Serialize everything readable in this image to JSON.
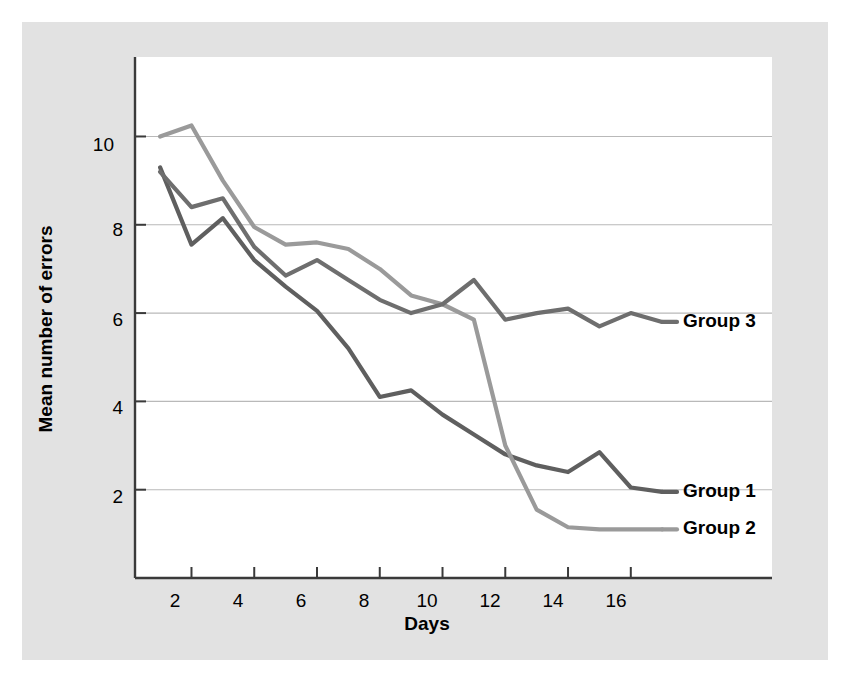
{
  "chart_data": {
    "type": "line",
    "title": "",
    "xlabel": "Days",
    "ylabel": "Mean number of errors",
    "xlim": [
      0.2,
      20.5
    ],
    "ylim": [
      0,
      11.8
    ],
    "xticks": [
      2,
      4,
      6,
      8,
      10,
      12,
      14,
      16
    ],
    "yticks": [
      2,
      4,
      6,
      8,
      10
    ],
    "xtick_labels": [
      "2",
      "4",
      "6",
      "8",
      "10",
      "12",
      "14",
      "16"
    ],
    "ytick_labels": [
      "2",
      "4",
      "6",
      "8",
      "10"
    ],
    "grid": "horizontal",
    "legend_position": "inline-right",
    "x": [
      1,
      2,
      3,
      4,
      5,
      6,
      7,
      8,
      9,
      10,
      11,
      12,
      13,
      14,
      15,
      16,
      17
    ],
    "series": [
      {
        "name": "Group 1",
        "color": "#5f5f5f",
        "values": [
          9.3,
          7.55,
          8.15,
          7.2,
          6.6,
          6.05,
          5.2,
          4.1,
          4.25,
          3.7,
          3.25,
          2.8,
          2.55,
          2.4,
          2.85,
          2.05,
          1.95
        ],
        "label_x": 17.6,
        "label_y": 1.95
      },
      {
        "name": "Group 2",
        "color": "#9a9a9a",
        "values": [
          10.0,
          10.25,
          9.0,
          7.95,
          7.55,
          7.6,
          7.45,
          7.0,
          6.4,
          6.2,
          5.85,
          3.0,
          1.55,
          1.15,
          1.1,
          1.1,
          1.1
        ],
        "label_x": 17.6,
        "label_y": 1.1
      },
      {
        "name": "Group 3",
        "color": "#6e6e6e",
        "values": [
          9.2,
          8.4,
          8.6,
          7.5,
          6.85,
          7.2,
          6.75,
          6.3,
          6.0,
          6.2,
          6.75,
          5.85,
          6.0,
          6.1,
          5.7,
          6.0,
          5.8
        ],
        "label_x": 17.6,
        "label_y": 5.8
      }
    ]
  },
  "labels": {
    "x_title": "Days",
    "y_title": "Mean number of errors",
    "group1": "Group 1",
    "group2": "Group 2",
    "group3": "Group 3",
    "x_2": "2",
    "x_4": "4",
    "x_6": "6",
    "x_8": "8",
    "x_10": "10",
    "x_12": "12",
    "x_14": "14",
    "x_16": "16",
    "y_2": "2",
    "y_4": "4",
    "y_6": "6",
    "y_8": "8",
    "y_10": "10"
  },
  "colors": {
    "panel": "#e2e2e2",
    "plot_background": "#ffffff",
    "axis": "#3a3a3a",
    "gridline": "#b9b9b9",
    "group1": "#5f5f5f",
    "group2": "#9a9a9a",
    "group3": "#6e6e6e"
  }
}
